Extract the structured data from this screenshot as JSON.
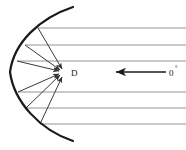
{
  "figure": {
    "kind": "parabolic-reflector-ray-diagram",
    "background_color": "#ffffff",
    "stroke_color": "#1a1a1a",
    "ray_color": "#555555",
    "incoming_ray_color": "#888888",
    "width": 186,
    "height": 150
  },
  "labels": {
    "focus_label": "D",
    "angle_label": "0",
    "angle_superscript": "°"
  },
  "focus": {
    "x": 63,
    "y": 72,
    "label_x": 71,
    "label_y": 76
  },
  "reflector": {
    "name": "parabolic-dish",
    "vertex_x": 10,
    "vertex_y": 72,
    "top_end_x": 73,
    "top_end_y": 7,
    "bottom_end_x": 73,
    "bottom_end_y": 141,
    "stroke_width": 2.2,
    "path": "M 73 7 C 40 18 14 42 10 72 C 14 102 40 130 73 141"
  },
  "incoming_rays": [
    {
      "name": "incoming-ray-1",
      "y": 28,
      "x_start": 186,
      "x_end": 38
    },
    {
      "name": "incoming-ray-2",
      "y": 45,
      "x_start": 186,
      "x_end": 25
    },
    {
      "name": "incoming-ray-3",
      "y": 61,
      "x_start": 186,
      "x_end": 17
    },
    {
      "name": "incoming-ray-4",
      "y": 92,
      "x_start": 186,
      "x_end": 18
    },
    {
      "name": "incoming-ray-5",
      "y": 108,
      "x_start": 186,
      "x_end": 26
    },
    {
      "name": "incoming-ray-6",
      "y": 124,
      "x_start": 186,
      "x_end": 40
    }
  ],
  "reflected_rays": [
    {
      "name": "reflected-ray-1",
      "x1": 38,
      "y1": 28,
      "x2": 62,
      "y2": 69
    },
    {
      "name": "reflected-ray-2",
      "x1": 25,
      "y1": 45,
      "x2": 60,
      "y2": 70
    },
    {
      "name": "reflected-ray-3",
      "x1": 17,
      "y1": 61,
      "x2": 59,
      "y2": 71
    },
    {
      "name": "reflected-ray-4",
      "x1": 18,
      "y1": 92,
      "x2": 59,
      "y2": 74
    },
    {
      "name": "reflected-ray-5",
      "x1": 26,
      "y1": 108,
      "x2": 60,
      "y2": 75
    },
    {
      "name": "reflected-ray-6",
      "x1": 40,
      "y1": 124,
      "x2": 62,
      "y2": 77
    }
  ],
  "axis_arrow": {
    "name": "boresight-axis-arrow",
    "x_start": 166,
    "x_end": 116,
    "y": 72,
    "stroke_width": 1.6,
    "direction": "left"
  }
}
